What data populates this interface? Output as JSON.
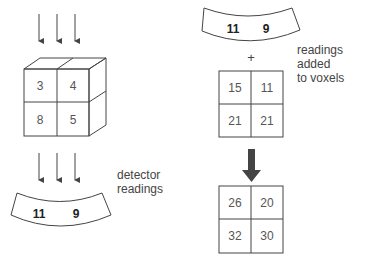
{
  "cube": {
    "values": [
      "3",
      "4",
      "8",
      "5"
    ]
  },
  "detector_bottom": {
    "values": [
      "11",
      "9"
    ],
    "label_line1": "detector",
    "label_line2": "readings"
  },
  "detector_top": {
    "values": [
      "11",
      "9"
    ]
  },
  "plus_sign": "+",
  "added_label": {
    "line1": "readings added",
    "line2": "to voxels"
  },
  "grid_middle": {
    "values": [
      "15",
      "11",
      "21",
      "21"
    ]
  },
  "grid_result": {
    "values": [
      "26",
      "20",
      "32",
      "30"
    ]
  },
  "colors": {
    "line": "#444444",
    "arrow_fill": "#444444",
    "text": "#555555"
  }
}
